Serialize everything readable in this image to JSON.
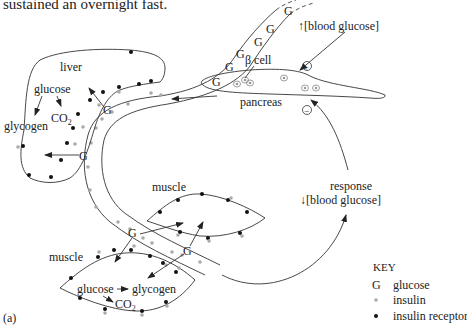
{
  "caption": "sustained an overnight fast.",
  "panel_label": "(a)",
  "labels": {
    "liver": "liver",
    "liver_glucose": "glucose",
    "liver_co2": "CO",
    "liver_co2_sub": "2",
    "liver_glycogen": "glycogen",
    "pancreas": "pancreas",
    "beta_cell": "β cell",
    "blood_glucose_up": "[blood glucose]",
    "plus": "+",
    "minus": "−",
    "response": "response",
    "blood_glucose_down": "[blood glucose]",
    "muscle_upper": "muscle",
    "muscle_lower": "muscle",
    "muscle_glucose": "glucose",
    "muscle_glycogen": "glycogen",
    "muscle_co2": "CO",
    "muscle_co2_sub": "2",
    "glucose_symbol": "G"
  },
  "key": {
    "title": "KEY",
    "items": [
      {
        "symbol": "G",
        "label": "glucose"
      },
      {
        "symbol": "grey-dot",
        "label": "insulin"
      },
      {
        "symbol": "black-dot",
        "label": "insulin receptor"
      }
    ]
  },
  "colors": {
    "line": "#333333",
    "insulin": "#aaaaaa",
    "receptor": "#111111"
  }
}
